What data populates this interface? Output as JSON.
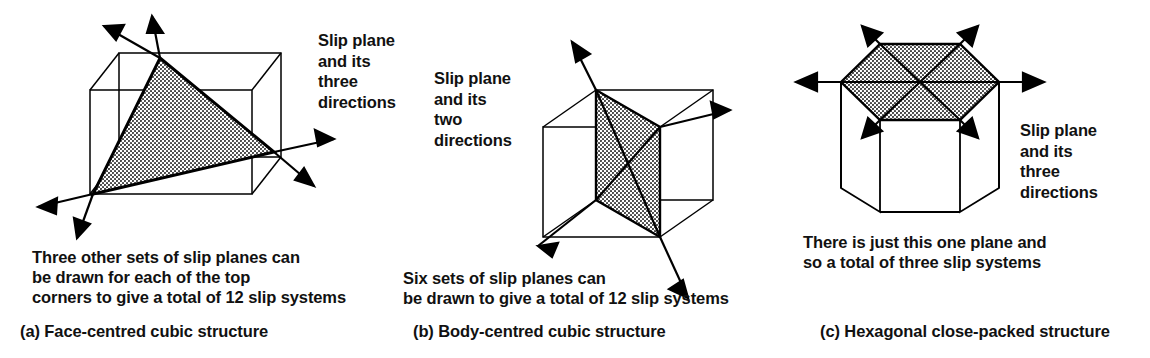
{
  "figure": {
    "background_color": "#ffffff",
    "line_color": "#000000",
    "shade_fill_color": "#c9c9c9"
  },
  "panels": [
    {
      "id": "a",
      "caption": "(a) Face-centred cubic structure",
      "callout": "Slip plane\nand its\nthree\ndirections",
      "note": "Three other sets of slip planes can\nbe drawn for each of the top\ncorners to give a total of 12 slip systems",
      "shape": "cube-with-shaded-triangular-slip-plane",
      "arrow_count": 6,
      "slip_directions": 3,
      "slip_systems": 12
    },
    {
      "id": "b",
      "caption": "(b) Body-centred cubic structure",
      "callout": "Slip plane\nand its\ntwo\ndirections",
      "note": "Six sets of slip planes can\nbe drawn to give a total of 12 slip systems",
      "shape": "cube-with-shaded-diagonal-slip-plane",
      "arrow_count": 4,
      "slip_directions": 2,
      "slip_systems": 12
    },
    {
      "id": "c",
      "caption": "(c) Hexagonal close-packed structure",
      "callout": "Slip plane\nand its\nthree\ndirections",
      "note": "There is just this one plane and\nso a total of three slip systems",
      "shape": "hexagonal-prism-with-shaded-basal-slip-plane",
      "arrow_count": 6,
      "slip_directions": 3,
      "slip_systems": 3
    }
  ]
}
